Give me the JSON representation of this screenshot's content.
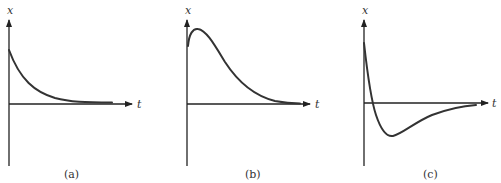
{
  "figure": {
    "panels": [
      {
        "id": "a",
        "caption": "(a)",
        "x_axis_label": "t",
        "y_axis_label": "x",
        "description": "Overdamped exponential decay from positive initial value to zero without crossing"
      },
      {
        "id": "b",
        "caption": "(b)",
        "x_axis_label": "t",
        "y_axis_label": "x",
        "description": "Initial rise to a maximum then decay toward zero without crossing"
      },
      {
        "id": "c",
        "caption": "(c)",
        "x_axis_label": "t",
        "y_axis_label": "x",
        "description": "Rapid decay crossing zero once, reaching a negative minimum, then returning toward zero from below"
      }
    ],
    "colors": {
      "axis": "#222222",
      "curve": "#333333",
      "background": "#ffffff"
    }
  }
}
